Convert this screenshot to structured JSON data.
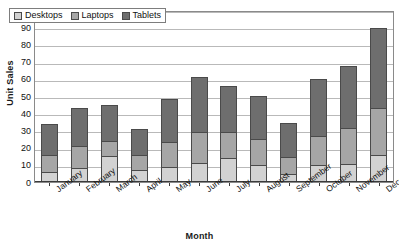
{
  "chart_data": {
    "type": "bar",
    "stacked": true,
    "title": "",
    "xlabel": "Month",
    "ylabel": "Unit Sales",
    "categories": [
      "January",
      "February",
      "March",
      "April",
      "May",
      "June",
      "July",
      "August",
      "September",
      "October",
      "November",
      "December"
    ],
    "series": [
      {
        "name": "Desktops",
        "color": "#d2d2d2",
        "values": [
          6,
          8,
          15,
          7,
          9,
          11,
          14,
          10,
          4.5,
          10,
          10.5,
          15.5
        ]
      },
      {
        "name": "Laptops",
        "color": "#a6a6a6",
        "values": [
          10,
          13,
          9,
          9,
          14,
          18,
          15,
          15,
          10,
          17,
          21,
          27.5
        ]
      },
      {
        "name": "Tablets",
        "color": "#6e6e6e",
        "values": [
          18,
          22,
          21,
          15,
          25,
          32,
          27,
          25,
          20,
          33,
          36,
          46.5
        ]
      }
    ],
    "totals": [
      34,
      43,
      45,
      31,
      48,
      61,
      56,
      50,
      34.5,
      60,
      67,
      89.5
    ],
    "ylim": [
      0,
      100
    ],
    "ytick_step": 10,
    "yticks": [
      100,
      90,
      80,
      70,
      60,
      50,
      40,
      30,
      20,
      10,
      0
    ],
    "grid": true,
    "legend_position": "top-left"
  },
  "legend": {
    "items": [
      {
        "label": "Desktops",
        "color": "#d2d2d2"
      },
      {
        "label": "Laptops",
        "color": "#a6a6a6"
      },
      {
        "label": "Tablets",
        "color": "#6e6e6e"
      }
    ]
  }
}
